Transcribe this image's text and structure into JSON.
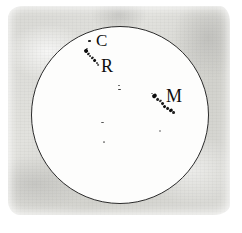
{
  "figure": {
    "kind": "historical-sunspot-observation-drawing",
    "medium_description": "ink drawing on aged gray paper square",
    "disk_label": "solar disk",
    "colors": {
      "paper": "#dcdcd8",
      "disk_fill": "#fdfdfc",
      "disk_outline": "#2b2b2b",
      "ink": "#0d0d0d",
      "page_background": "#ffffff"
    }
  },
  "disk": {
    "cx": 120,
    "cy": 115,
    "r": 89
  },
  "annotations": [
    {
      "id": "label-c",
      "text": "C",
      "x": 96,
      "y": 32,
      "size": 17
    },
    {
      "id": "label-r",
      "text": "R",
      "x": 101,
      "y": 57,
      "size": 18
    },
    {
      "id": "label-m",
      "text": "M",
      "x": 166,
      "y": 87,
      "size": 18
    }
  ],
  "spot_groups": [
    {
      "id": "group-c",
      "label": "C",
      "description": "small isolated dot just left of letter C",
      "spots": [
        {
          "x": 89.5,
          "y": 40.5,
          "w": 2.6,
          "h": 1.6,
          "rot": -10,
          "op": 0.92
        }
      ]
    },
    {
      "id": "group-r",
      "label": "R",
      "description": "elongated diagonal chain of dark spots running upper-left to lower-right",
      "spots": [
        {
          "x": 85.5,
          "y": 51.0,
          "w": 4.0,
          "h": 3.6,
          "rot": -35,
          "op": 1.0
        },
        {
          "x": 88.0,
          "y": 54.0,
          "w": 2.6,
          "h": 2.2,
          "rot": -35,
          "op": 0.95
        },
        {
          "x": 90.2,
          "y": 56.4,
          "w": 2.2,
          "h": 1.9,
          "rot": -35,
          "op": 0.85
        },
        {
          "x": 92.0,
          "y": 58.4,
          "w": 2.6,
          "h": 2.4,
          "rot": -35,
          "op": 0.95
        },
        {
          "x": 94.3,
          "y": 60.6,
          "w": 3.0,
          "h": 2.6,
          "rot": -35,
          "op": 1.0
        },
        {
          "x": 96.6,
          "y": 62.8,
          "w": 2.2,
          "h": 2.0,
          "rot": -35,
          "op": 0.8
        },
        {
          "x": 98.2,
          "y": 64.4,
          "w": 1.8,
          "h": 1.5,
          "rot": -35,
          "op": 0.7
        },
        {
          "x": 86.8,
          "y": 48.4,
          "w": 1.6,
          "h": 1.3,
          "rot": 0,
          "op": 0.6
        }
      ]
    },
    {
      "id": "group-m",
      "label": "M",
      "description": "large elongated diagonal chain of dark spots, largest group on the disk",
      "spots": [
        {
          "x": 154.0,
          "y": 96.0,
          "w": 4.6,
          "h": 4.0,
          "rot": -35,
          "op": 1.0
        },
        {
          "x": 157.5,
          "y": 99.0,
          "w": 3.0,
          "h": 2.6,
          "rot": -35,
          "op": 0.9
        },
        {
          "x": 160.0,
          "y": 101.5,
          "w": 2.6,
          "h": 2.2,
          "rot": -35,
          "op": 0.85
        },
        {
          "x": 162.4,
          "y": 103.8,
          "w": 3.2,
          "h": 2.8,
          "rot": -35,
          "op": 0.95
        },
        {
          "x": 165.0,
          "y": 106.0,
          "w": 3.4,
          "h": 3.0,
          "rot": -35,
          "op": 1.0
        },
        {
          "x": 167.8,
          "y": 108.2,
          "w": 3.0,
          "h": 2.6,
          "rot": -35,
          "op": 0.95
        },
        {
          "x": 170.4,
          "y": 110.2,
          "w": 3.6,
          "h": 3.2,
          "rot": -35,
          "op": 1.0
        },
        {
          "x": 173.2,
          "y": 112.0,
          "w": 3.0,
          "h": 2.6,
          "rot": -20,
          "op": 0.9
        },
        {
          "x": 151.8,
          "y": 93.6,
          "w": 2.0,
          "h": 1.6,
          "rot": 0,
          "op": 0.55
        }
      ]
    },
    {
      "id": "group-center-upper",
      "label": "",
      "description": "pair of tiny faint spots near disk centre, upper",
      "spots": [
        {
          "x": 119.0,
          "y": 85.5,
          "w": 2.4,
          "h": 1.5,
          "rot": 0,
          "op": 0.72
        },
        {
          "x": 119.6,
          "y": 89.5,
          "w": 2.8,
          "h": 1.8,
          "rot": 0,
          "op": 0.8
        }
      ]
    },
    {
      "id": "group-center-lower",
      "label": "",
      "description": "tiny faint dash below disk centre",
      "spots": [
        {
          "x": 102.0,
          "y": 122.5,
          "w": 3.0,
          "h": 1.5,
          "rot": 0,
          "op": 0.7
        }
      ]
    },
    {
      "id": "group-lower-left",
      "label": "",
      "description": "very faint speck lower-left of centre",
      "spots": [
        {
          "x": 104.0,
          "y": 142.0,
          "w": 2.4,
          "h": 1.4,
          "rot": 0,
          "op": 0.45
        }
      ]
    },
    {
      "id": "group-lower-right",
      "label": "",
      "description": "very faint speck lower-right of centre",
      "spots": [
        {
          "x": 160.0,
          "y": 131.0,
          "w": 2.4,
          "h": 1.6,
          "rot": 0,
          "op": 0.4
        }
      ]
    }
  ]
}
